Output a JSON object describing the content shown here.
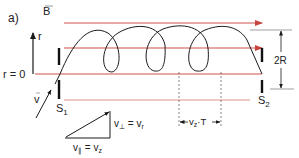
{
  "panel_label": "a)",
  "field_label": "B",
  "axis": {
    "r_label": "r",
    "origin_label": "r = 0"
  },
  "velocity_label": "v",
  "slits": {
    "left": "S",
    "left_sub": "1",
    "right": "S",
    "right_sub": "2"
  },
  "dimension": {
    "diameter_label": "2R",
    "pitch_v": "v",
    "pitch_sub": "z",
    "pitch_T": "·T"
  },
  "triangle": {
    "perp_lhs": "v",
    "perp_sub": "⊥",
    "perp_eq": " = v",
    "perp_rhs_sub": "r",
    "par_lhs": "v",
    "par_sub": "∥",
    "par_eq": " = v",
    "par_rhs_sub": "z"
  },
  "colors": {
    "field_line": "#d0504a",
    "curve": "#1a1a1a",
    "text": "#222222"
  }
}
